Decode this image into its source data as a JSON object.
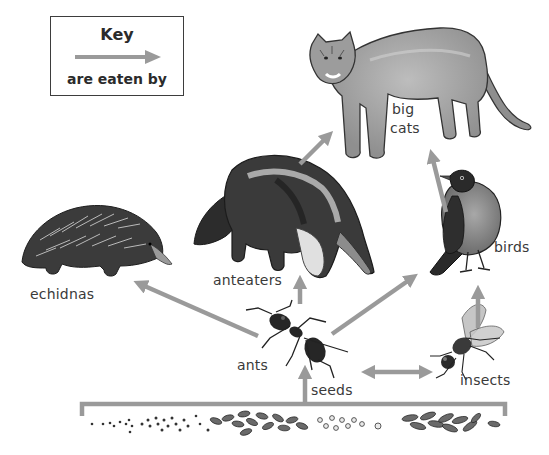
{
  "diagram": {
    "type": "food-web",
    "palette": {
      "arrow": "#9a9a9a",
      "text": "#3a3a3a",
      "ink": "#222222",
      "fur": "#8a8a8a"
    },
    "key": {
      "title": "Key",
      "caption": "are eaten by",
      "symbol": "arrow-right"
    },
    "nodes": {
      "big_cats": {
        "line1": "big",
        "line2": "cats"
      },
      "anteaters": {
        "label": "anteaters"
      },
      "echidnas": {
        "label": "echidnas"
      },
      "birds": {
        "label": "birds"
      },
      "ants": {
        "label": "ants"
      },
      "insects": {
        "label": "insects"
      },
      "seeds": {
        "label": "seeds"
      }
    },
    "edges": [
      {
        "from": "seeds",
        "to": "ants",
        "relation": "are eaten by"
      },
      {
        "from": "seeds",
        "to": "insects",
        "relation": "are eaten by"
      },
      {
        "from": "insects",
        "to": "ants",
        "relation": "are eaten by"
      },
      {
        "from": "ants",
        "to": "echidnas",
        "relation": "are eaten by"
      },
      {
        "from": "ants",
        "to": "anteaters",
        "relation": "are eaten by"
      },
      {
        "from": "ants",
        "to": "birds",
        "relation": "are eaten by"
      },
      {
        "from": "insects",
        "to": "birds",
        "relation": "are eaten by"
      },
      {
        "from": "anteaters",
        "to": "big_cats",
        "relation": "are eaten by"
      },
      {
        "from": "birds",
        "to": "big_cats",
        "relation": "are eaten by"
      }
    ]
  }
}
